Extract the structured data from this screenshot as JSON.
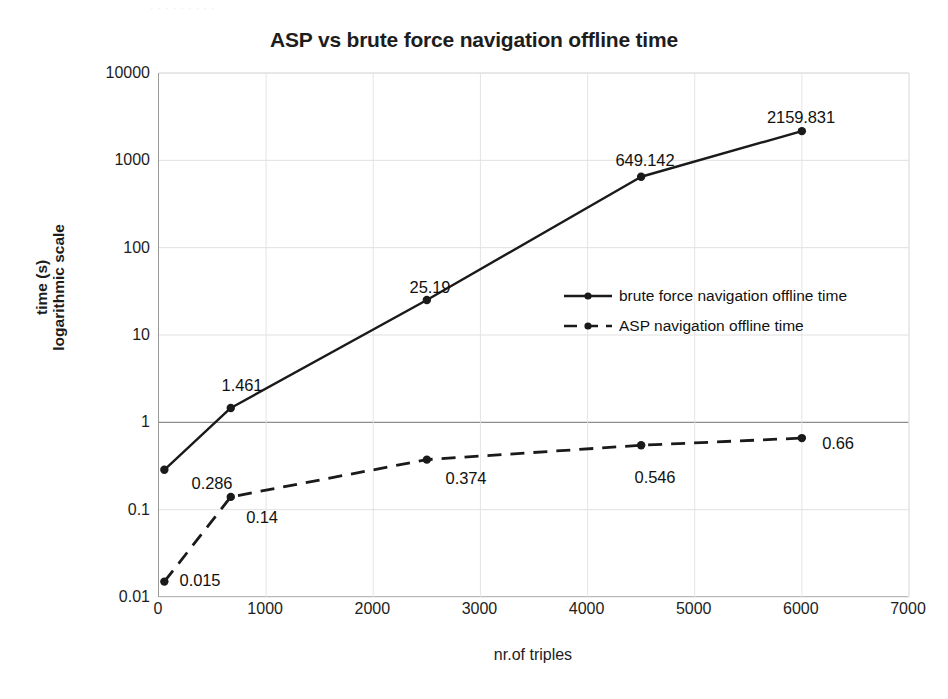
{
  "figure": {
    "scan_artifact_text": "·  ·   ·       ·        ·            ·       ·      ·   ·",
    "title": "ASP vs brute force navigation offline time",
    "x_axis_title": "nr.of triples",
    "y_axis_title_line1": "time (s)",
    "y_axis_title_line2": "logarithmic scale"
  },
  "chart_data": {
    "type": "line",
    "title": "ASP vs brute force navigation offline time",
    "xlabel": "nr.of triples",
    "ylabel": "time (s) logarithmic scale",
    "xlim": [
      0,
      7000
    ],
    "ylim": [
      0.01,
      10000
    ],
    "yscale": "log",
    "grid": true,
    "legend_position": "center-right",
    "x_ticks": [
      "0",
      "1000",
      "2000",
      "3000",
      "4000",
      "5000",
      "6000",
      "7000"
    ],
    "x_tick_values": [
      0,
      1000,
      2000,
      3000,
      4000,
      5000,
      6000,
      7000
    ],
    "y_ticks": [
      "0.01",
      "0.1",
      "1",
      "10",
      "100",
      "1000",
      "10000"
    ],
    "y_tick_values": [
      0.01,
      0.1,
      1,
      10,
      100,
      1000,
      10000
    ],
    "x": [
      50,
      670,
      2500,
      4500,
      6000
    ],
    "series": [
      {
        "name": "brute force navigation offline time",
        "style": "solid",
        "color": "#1a1a1a",
        "values": [
          0.286,
          1.461,
          25.19,
          649.142,
          2159.831
        ],
        "labels": [
          "0.286",
          "1.461",
          "25.19",
          "649.142",
          "2159.831"
        ]
      },
      {
        "name": "ASP navigation offline time",
        "style": "dashed",
        "color": "#1a1a1a",
        "values": [
          0.015,
          0.14,
          0.374,
          0.546,
          0.66
        ],
        "labels": [
          "0.015",
          "0.14",
          "0.374",
          "0.546",
          "0.66"
        ]
      }
    ]
  },
  "legend": {
    "items": [
      {
        "label": "brute force navigation offline time",
        "style": "solid"
      },
      {
        "label": "ASP navigation offline time",
        "style": "dashed"
      }
    ]
  },
  "annotations": {
    "brute_force": [
      {
        "text": "0.286",
        "x": 212,
        "y": 483
      },
      {
        "text": "1.461",
        "x": 242,
        "y": 385
      },
      {
        "text": "25.19",
        "x": 430,
        "y": 287
      },
      {
        "text": "649.142",
        "x": 645,
        "y": 160
      },
      {
        "text": "2159.831",
        "x": 801,
        "y": 117
      }
    ],
    "asp": [
      {
        "text": "0.015",
        "x": 200,
        "y": 580
      },
      {
        "text": "0.14",
        "x": 262,
        "y": 517
      },
      {
        "text": "0.374",
        "x": 466,
        "y": 478
      },
      {
        "text": "0.546",
        "x": 655,
        "y": 477
      },
      {
        "text": "0.66",
        "x": 838,
        "y": 443
      }
    ]
  }
}
